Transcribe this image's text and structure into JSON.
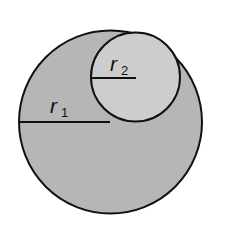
{
  "diagram": {
    "type": "circles",
    "large_circle": {
      "label": "r",
      "subscript": "1",
      "fill": "#b6b6b6",
      "stroke": "#111111"
    },
    "small_circle": {
      "label": "r",
      "subscript": "2",
      "fill": "#cdcdcd",
      "stroke": "#111111"
    }
  }
}
